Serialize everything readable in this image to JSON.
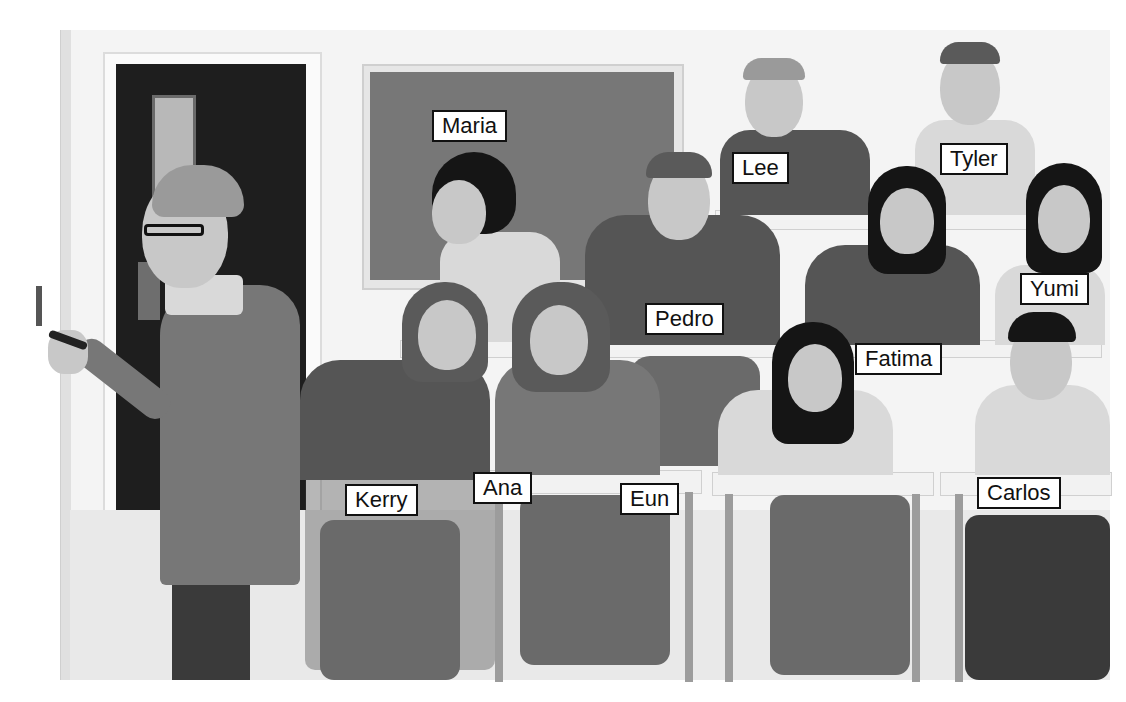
{
  "scene": {
    "description": "Classroom illustration with a teacher writing on the wall and students seated at desks, each labeled with a name",
    "teacher": {
      "label": null
    },
    "labels": [
      {
        "id": "maria",
        "text": "Maria"
      },
      {
        "id": "lee",
        "text": "Lee"
      },
      {
        "id": "tyler",
        "text": "Tyler"
      },
      {
        "id": "pedro",
        "text": "Pedro"
      },
      {
        "id": "yumi",
        "text": "Yumi"
      },
      {
        "id": "fatima",
        "text": "Fatima"
      },
      {
        "id": "kerry",
        "text": "Kerry"
      },
      {
        "id": "ana",
        "text": "Ana"
      },
      {
        "id": "eun",
        "text": "Eun"
      },
      {
        "id": "carlos",
        "text": "Carlos"
      }
    ]
  }
}
